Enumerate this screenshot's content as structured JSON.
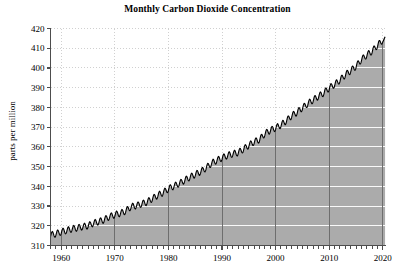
{
  "chart_data": {
    "type": "area",
    "title": "Monthly Carbon Dioxide Concentration",
    "xlabel": "",
    "ylabel": "parts per million",
    "xlim": [
      1958,
      2020.5
    ],
    "ylim": [
      310,
      420
    ],
    "grid": true,
    "legend": null,
    "fill_color": "#ababab",
    "line_color": "#000000",
    "gridline_color_above_fill": "#d0d0d0",
    "gridline_color_in_fill": "#ffffff",
    "background_color": "#ffffff",
    "axis_color": "#4d4d4d",
    "yticks": [
      310,
      320,
      330,
      340,
      350,
      360,
      370,
      380,
      390,
      400,
      410,
      420
    ],
    "ytick_labels": [
      "310",
      "320",
      "330",
      "340",
      "350",
      "360",
      "370",
      "380",
      "390",
      "400",
      "410",
      "420"
    ],
    "xticks": [
      1960,
      1970,
      1980,
      1990,
      2000,
      2010,
      2020
    ],
    "xtick_labels": [
      "1960",
      "1970",
      "1980",
      "1990",
      "2000",
      "2010",
      "2020"
    ],
    "xminor_tick_step": 1,
    "seasonal_amplitude_ppm": 3.2,
    "series": [
      {
        "name": "Monthly mean CO2 (Mauna Loa)",
        "x": [
          1958,
          1959,
          1960,
          1961,
          1962,
          1963,
          1964,
          1965,
          1966,
          1967,
          1968,
          1969,
          1970,
          1971,
          1972,
          1973,
          1974,
          1975,
          1976,
          1977,
          1978,
          1979,
          1980,
          1981,
          1982,
          1983,
          1984,
          1985,
          1986,
          1987,
          1988,
          1989,
          1990,
          1991,
          1992,
          1993,
          1994,
          1995,
          1996,
          1997,
          1998,
          1999,
          2000,
          2001,
          2002,
          2003,
          2004,
          2005,
          2006,
          2007,
          2008,
          2009,
          2010,
          2011,
          2012,
          2013,
          2014,
          2015,
          2016,
          2017,
          2018,
          2019,
          2020
        ],
        "values": [
          315.3,
          315.9,
          316.9,
          317.6,
          318.4,
          318.9,
          319.5,
          320.0,
          321.3,
          322.1,
          323.0,
          324.6,
          325.6,
          326.3,
          327.4,
          329.6,
          330.2,
          331.1,
          332.0,
          333.8,
          335.4,
          336.8,
          338.7,
          340.1,
          341.4,
          343.0,
          344.6,
          346.0,
          347.4,
          349.2,
          351.6,
          353.1,
          354.4,
          355.6,
          356.4,
          357.1,
          358.8,
          360.8,
          362.6,
          363.7,
          366.7,
          368.4,
          369.6,
          371.1,
          373.2,
          375.8,
          377.5,
          379.8,
          381.9,
          383.8,
          385.6,
          387.4,
          389.9,
          391.6,
          393.8,
          396.5,
          398.6,
          400.8,
          404.2,
          406.5,
          408.5,
          411.4,
          414.2
        ]
      }
    ]
  }
}
